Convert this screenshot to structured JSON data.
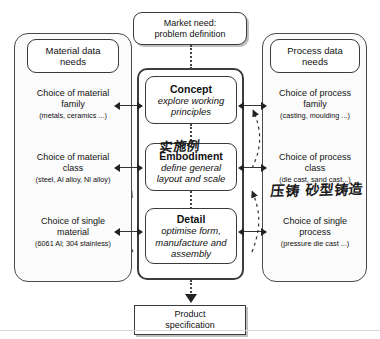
{
  "diagram": {
    "top_box": {
      "line1": "Market need:",
      "line2": "problem definition"
    },
    "bottom_box": {
      "line1": "Product",
      "line2": "specification"
    },
    "stages": [
      {
        "name": "Concept",
        "desc_line1": "explore working",
        "desc_line2": "principles",
        "desc_line3": ""
      },
      {
        "name": "Embodiment",
        "desc_line1": "define general",
        "desc_line2": "layout and scale",
        "desc_line3": ""
      },
      {
        "name": "Detail",
        "desc_line1": "optimise form,",
        "desc_line2": "manufacture and",
        "desc_line3": "assembly"
      }
    ],
    "left_column": {
      "header_line1": "Material data",
      "header_line2": "needs",
      "items": [
        {
          "line1": "Choice of material",
          "line2": "family",
          "examples": "(metals, ceramics ...)"
        },
        {
          "line1": "Choice of material",
          "line2": "class",
          "examples": "(steel, Al alloy, Nl alloy)"
        },
        {
          "line1": "Choice of single",
          "line2": "material",
          "examples": "(6061 Al;  304 stainless)"
        }
      ]
    },
    "right_column": {
      "header_line1": "Process data",
      "header_line2": "needs",
      "items": [
        {
          "line1": "Choice of process",
          "line2": "family",
          "examples": "(casting, moulding ...)"
        },
        {
          "line1": "Choice of process",
          "line2": "class",
          "examples": "(die cast, sand cast...)"
        },
        {
          "line1": "Choice of single",
          "line2": "process",
          "examples": "(pressure die cast ...)"
        }
      ]
    },
    "annotations": [
      {
        "text": "实施例",
        "note": "handwritten above Embodiment"
      },
      {
        "text": "压铸  砂型铸造",
        "note": "handwritten below die cast, sand cast"
      }
    ]
  },
  "colors": {
    "background": "#ffffff",
    "box_border": "#3a3a3a",
    "column_border": "#4a4a4a",
    "center_frame_border": "#3d3d3d",
    "text": "#111111",
    "connector": "#333333",
    "handwriting": "#1b1b1b",
    "divider": "#d8d8d8"
  }
}
